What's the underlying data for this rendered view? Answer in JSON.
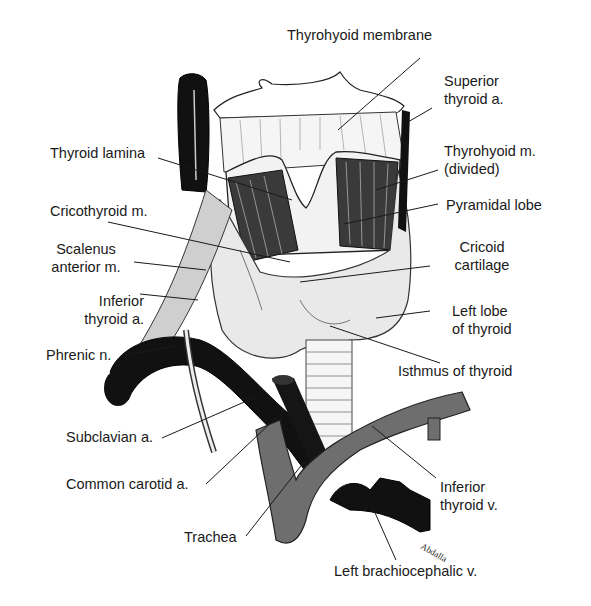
{
  "labels": {
    "thyrohyoid_membrane": "Thyrohyoid membrane",
    "superior_thyroid_a": [
      "Superior",
      "thyroid a."
    ],
    "thyroid_lamina": "Thyroid lamina",
    "thyrohyoid_m": [
      "Thyrohyoid m.",
      "(divided)"
    ],
    "cricothyroid_m": "Cricothyroid m.",
    "pyramidal_lobe": "Pyramidal lobe",
    "scalenus_anterior_m": [
      "Scalenus",
      "anterior  m."
    ],
    "cricoid_cartilage": [
      "Cricoid",
      "cartilage"
    ],
    "inferior_thyroid_a": [
      "Inferior",
      "thyroid a."
    ],
    "left_lobe_of_thyroid": [
      "Left lobe",
      "of thyroid"
    ],
    "phrenic_n": "Phrenic n.",
    "isthmus_of_thyroid": "Isthmus of thyroid",
    "subclavian_a": "Subclavian a.",
    "common_carotid_a": "Common carotid a.",
    "inferior_thyroid_v": [
      "Inferior",
      "thyroid v."
    ],
    "trachea": "Trachea",
    "left_brachiocephalic_v": "Left brachiocephalic v."
  },
  "signature": "Abdalla",
  "colors": {
    "ink": "#1a1a1a",
    "vessel_dark": "#111111",
    "vein_gray": "#6e6e6e",
    "gland": "#e9e9e9",
    "background": "#ffffff"
  }
}
